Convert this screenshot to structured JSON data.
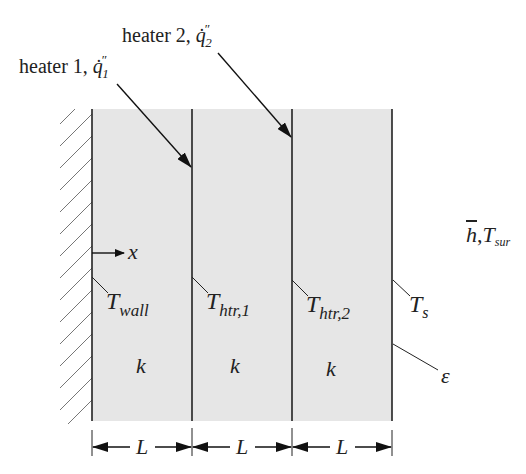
{
  "diagram": {
    "type": "composite wall heat conduction schematic",
    "heater1": {
      "label": "heater 1, ",
      "symbol": "q̇",
      "sup": "″",
      "sub": "1"
    },
    "heater2": {
      "label": "heater 2, ",
      "symbol": "q̇",
      "sup": "″",
      "sub": "2"
    },
    "x_axis": {
      "label": "x"
    },
    "temperatures": {
      "wall": {
        "main": "T",
        "sub": "wall"
      },
      "htr1": {
        "main": "T",
        "sub": "htr,1"
      },
      "htr2": {
        "main": "T",
        "sub": "htr,2"
      },
      "surface": {
        "main": "T",
        "sub": "s"
      }
    },
    "layers": [
      {
        "conductivity": "k",
        "thickness": "L"
      },
      {
        "conductivity": "k",
        "thickness": "L"
      },
      {
        "conductivity": "k",
        "thickness": "L"
      }
    ],
    "emissivity": "ε",
    "ambient": {
      "h": "h",
      "comma": ",",
      "T": "T",
      "sub": "sur"
    },
    "colors": {
      "slab": "#e6e6e6",
      "line": "#222222"
    }
  }
}
